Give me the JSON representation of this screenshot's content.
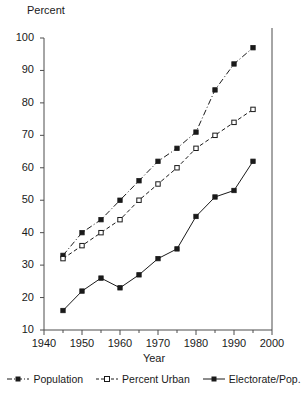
{
  "chart_data": {
    "type": "line",
    "title": "",
    "ylabel": "Percent",
    "xlabel": "Year",
    "xlim": [
      1940,
      2000
    ],
    "ylim": [
      10,
      100
    ],
    "xticks": [
      1940,
      1950,
      1960,
      1970,
      1980,
      1990,
      2000
    ],
    "xtick_labels": [
      "1940",
      "1950",
      "1960",
      "1970",
      "1980",
      "1990",
      "2000"
    ],
    "xminor_ticks": [
      1945,
      1955,
      1965,
      1975,
      1985,
      1995
    ],
    "yticks": [
      10,
      20,
      30,
      40,
      50,
      60,
      70,
      80,
      90,
      100
    ],
    "ytick_labels": [
      "10",
      "20",
      "30",
      "40",
      "50",
      "60",
      "70",
      "80",
      "90",
      "100"
    ],
    "grid": false,
    "legend_position": "bottom",
    "x": [
      1945,
      1950,
      1955,
      1960,
      1965,
      1970,
      1975,
      1980,
      1985,
      1990,
      1995
    ],
    "series": [
      {
        "name": "Population",
        "line_style": "dash-dot",
        "marker": "filled-square",
        "color": "#1a1a1a",
        "values": [
          33,
          40,
          44,
          50,
          56,
          62,
          66,
          71,
          84,
          92,
          97
        ]
      },
      {
        "name": "Percent Urban",
        "line_style": "dashed",
        "marker": "open-square",
        "color": "#1a1a1a",
        "values": [
          32,
          36,
          40,
          44,
          50,
          55,
          60,
          66,
          70,
          74,
          78
        ]
      },
      {
        "name": "Electorate/Pop.",
        "line_style": "solid",
        "marker": "filled-square",
        "color": "#1a1a1a",
        "values": [
          16,
          22,
          26,
          23,
          27,
          32,
          35,
          45,
          51,
          53,
          62
        ]
      }
    ],
    "border_line_x": 2000
  }
}
